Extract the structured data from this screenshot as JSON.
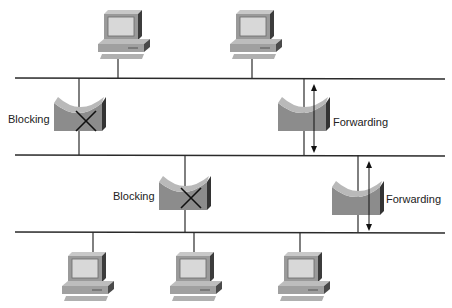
{
  "diagram": {
    "type": "spanning-tree-bridged-network",
    "segments": [
      {
        "id": "segment-1",
        "y": 78
      },
      {
        "id": "segment-2",
        "y": 155
      },
      {
        "id": "segment-3",
        "y": 232
      }
    ],
    "bridges": [
      {
        "id": "bridge-top-left",
        "state": "Blocking",
        "label_side": "left"
      },
      {
        "id": "bridge-top-right",
        "state": "Forwarding",
        "label_side": "right"
      },
      {
        "id": "bridge-mid-left",
        "state": "Blocking",
        "label_side": "left"
      },
      {
        "id": "bridge-mid-right",
        "state": "Forwarding",
        "label_side": "right"
      }
    ],
    "hosts": {
      "top_segment_count": 2,
      "bottom_segment_count": 3
    }
  },
  "labels": {
    "blocking_top": "Blocking",
    "forwarding_top": "Forwarding",
    "blocking_mid": "Blocking",
    "forwarding_mid": "Forwarding"
  },
  "colors": {
    "line": "#2a2a2a",
    "bridge_face": "#8e8e8e",
    "bridge_top": "#b5b5b5",
    "bridge_side": "#3a3a3a",
    "pc_body": "#a8a8a8",
    "pc_screen": "#d9d9d9"
  }
}
